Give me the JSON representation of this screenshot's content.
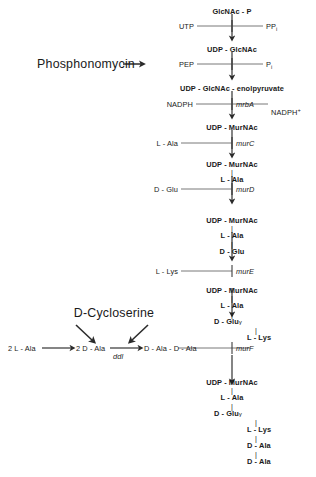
{
  "diagram": {
    "main_axis_x": 232,
    "colors": {
      "text": "#1a1a1a",
      "line": "#5a5a5a",
      "arrow": "#2a2a2a",
      "background": "#ffffff"
    }
  },
  "drugs": [
    {
      "name": "phosphonomycin",
      "label": "Phosphonomycin"
    },
    {
      "name": "d-cycloserine",
      "label": "D-Cycloserine"
    }
  ],
  "compounds": {
    "glcnac_p": "GlcNAc - P",
    "udp_glcnac": "UDP - GlcNAc",
    "udp_glcnac_enolpyruvate": "UDP - GlcNAc - enolpyruvate",
    "udp_murnac_1": "UDP - MurNAc",
    "udp_murnac_2": "UDP - MurNAc",
    "udp_murnac_3": "UDP - MurNAc",
    "udp_murnac_4": "UDP - MurNAc",
    "udp_murnac_5": "UDP - MurNAc"
  },
  "substrates": {
    "utp": "UTP",
    "pep": "PEP",
    "nadph": "NADPH",
    "l_ala_murc": "L - Ala",
    "d_glu_murd": "D - Glu",
    "l_lys_mure": "L - Lys"
  },
  "products": {
    "ppi_base": "PP",
    "ppi_sub": "i",
    "pi_base": "P",
    "pi_sub": "i",
    "nadph_plus_base": "NADPH",
    "nadph_plus_sup": "+"
  },
  "enzymes": {
    "mrba": "mrbA",
    "murc": "murC",
    "murd": "murD",
    "mure": "murE",
    "murf": "murF",
    "ddl": "ddl"
  },
  "residues": {
    "l_ala": "L - Ala",
    "d_glu": "D - Glu",
    "l_lys": "L - Lys",
    "d_ala": "D - Ala",
    "gamma": "γ",
    "bond": "|"
  },
  "dala_branch": {
    "two_l_ala": "2 L - Ala",
    "two_d_ala": "2 D - Ala",
    "d_ala_d_ala": "D - Ala - D - Ala"
  },
  "chains": {
    "stack_murd_product": [
      "UDP - MurNAc",
      "L - Ala"
    ],
    "stack_mure_substrate": [
      "UDP - MurNAc",
      "L - Ala",
      "D - Glu"
    ],
    "stack_murf_substrate": [
      "UDP - MurNAc",
      "L - Ala",
      "D - Glu",
      "L - Lys"
    ],
    "stack_final": [
      "UDP - MurNAc",
      "L - Ala",
      "D - Glu",
      "L - Lys",
      "D - Ala",
      "D - Ala"
    ]
  }
}
